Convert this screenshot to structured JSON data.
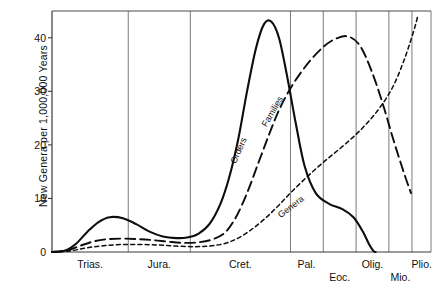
{
  "figure": {
    "ylabel": "New Genera per 1,000,000 Years",
    "caption": ""
  },
  "chart_data": {
    "type": "line",
    "title": "",
    "xlabel": "",
    "ylabel": "New Genera per 1,000,000 Years",
    "ylim": [
      0,
      45
    ],
    "yticks": [
      0,
      10,
      20,
      30,
      40
    ],
    "ytick_labels": [
      "0",
      "10",
      "20",
      "30",
      "40"
    ],
    "grid": "vertical-period-boundaries",
    "legend": "inline-curve-labels",
    "categories": [
      "Trias.",
      "Jura.",
      "Cret.",
      "Pal.",
      "Eoc.",
      "Olig.",
      "Mio.",
      "Plio."
    ],
    "xtick_labels": [
      "Trias.",
      "Jura.",
      "Cret.",
      "Pal.",
      "Eoc.",
      "Olig.",
      "Mio.",
      "Plio."
    ],
    "series": [
      {
        "name": "Orders",
        "style": "solid",
        "points": [
          [
            0.0,
            0.0
          ],
          [
            0.3,
            0.3
          ],
          [
            0.55,
            1.6
          ],
          [
            0.8,
            3.8
          ],
          [
            1.05,
            5.6
          ],
          [
            1.3,
            6.5
          ],
          [
            1.6,
            6.3
          ],
          [
            1.9,
            5.2
          ],
          [
            2.2,
            3.8
          ],
          [
            2.5,
            2.9
          ],
          [
            2.8,
            2.6
          ],
          [
            3.05,
            2.7
          ],
          [
            3.3,
            3.4
          ],
          [
            3.55,
            5.2
          ],
          [
            3.8,
            9.0
          ],
          [
            4.0,
            14.0
          ],
          [
            4.2,
            21.0
          ],
          [
            4.4,
            30.0
          ],
          [
            4.6,
            38.0
          ],
          [
            4.78,
            42.5
          ],
          [
            4.95,
            43.0
          ],
          [
            5.12,
            40.0
          ],
          [
            5.3,
            33.0
          ],
          [
            5.5,
            24.0
          ],
          [
            5.7,
            16.0
          ],
          [
            5.95,
            11.0
          ],
          [
            6.25,
            9.0
          ],
          [
            6.55,
            8.0
          ],
          [
            6.8,
            6.5
          ],
          [
            7.0,
            4.0
          ],
          [
            7.15,
            1.5
          ],
          [
            7.25,
            0.2
          ],
          [
            7.3,
            0.0
          ]
        ]
      },
      {
        "name": "Families",
        "style": "long-dash",
        "points": [
          [
            0.0,
            0.0
          ],
          [
            0.35,
            0.3
          ],
          [
            0.65,
            1.2
          ],
          [
            0.95,
            2.0
          ],
          [
            1.25,
            2.4
          ],
          [
            1.6,
            2.5
          ],
          [
            1.95,
            2.4
          ],
          [
            2.3,
            2.2
          ],
          [
            2.65,
            1.9
          ],
          [
            3.0,
            1.7
          ],
          [
            3.3,
            1.8
          ],
          [
            3.6,
            2.3
          ],
          [
            3.9,
            3.6
          ],
          [
            4.15,
            6.5
          ],
          [
            4.4,
            11.0
          ],
          [
            4.65,
            16.5
          ],
          [
            4.9,
            22.0
          ],
          [
            5.15,
            27.0
          ],
          [
            5.45,
            31.5
          ],
          [
            5.8,
            35.5
          ],
          [
            6.15,
            38.5
          ],
          [
            6.45,
            40.0
          ],
          [
            6.7,
            40.2
          ],
          [
            6.95,
            38.5
          ],
          [
            7.2,
            34.0
          ],
          [
            7.45,
            28.0
          ],
          [
            7.7,
            21.0
          ],
          [
            7.95,
            14.5
          ],
          [
            8.1,
            11.0
          ]
        ]
      },
      {
        "name": "Genera",
        "style": "short-dash",
        "points": [
          [
            0.0,
            0.0
          ],
          [
            0.4,
            0.2
          ],
          [
            0.8,
            0.8
          ],
          [
            1.2,
            1.2
          ],
          [
            1.6,
            1.4
          ],
          [
            2.0,
            1.4
          ],
          [
            2.4,
            1.3
          ],
          [
            2.8,
            1.1
          ],
          [
            3.2,
            1.0
          ],
          [
            3.55,
            1.1
          ],
          [
            3.9,
            1.6
          ],
          [
            4.2,
            2.6
          ],
          [
            4.5,
            4.2
          ],
          [
            4.8,
            6.2
          ],
          [
            5.1,
            8.6
          ],
          [
            5.4,
            11.2
          ],
          [
            5.75,
            14.0
          ],
          [
            6.1,
            16.6
          ],
          [
            6.45,
            19.0
          ],
          [
            6.8,
            21.5
          ],
          [
            7.1,
            24.0
          ],
          [
            7.4,
            27.0
          ],
          [
            7.7,
            31.0
          ],
          [
            7.95,
            36.0
          ],
          [
            8.15,
            41.0
          ],
          [
            8.25,
            44.0
          ]
        ]
      }
    ],
    "curve_labels": [
      {
        "text": "Orders",
        "x": 4.08,
        "y": 17.5,
        "angle": -66
      },
      {
        "text": "Families",
        "x": 4.78,
        "y": 24.5,
        "angle": -60
      },
      {
        "text": "Genera",
        "x": 5.12,
        "y": 7.6,
        "angle": -38
      }
    ]
  }
}
